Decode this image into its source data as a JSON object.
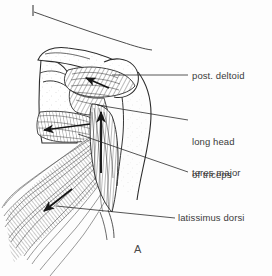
{
  "figure": {
    "panel_letter": "A",
    "view": "posterior shoulder dissection",
    "background_color": "#fdfdfd",
    "ink_color": "#2b2b2b",
    "text_color": "#3b3b3b"
  },
  "labels": [
    {
      "id": "post-deltoid",
      "text": "post. deltoid",
      "leader_from": [
        188,
        74
      ],
      "leader_to": [
        112,
        74
      ]
    },
    {
      "id": "long-head-of-triceps",
      "line1": "long head",
      "line2": "of triceps",
      "leader_from": [
        188,
        121
      ],
      "leader_to": [
        97,
        105
      ]
    },
    {
      "id": "teres-major",
      "text": "teres major",
      "leader_from": [
        188,
        172
      ],
      "leader_to": [
        78,
        135
      ]
    },
    {
      "id": "latissimus-dorsi",
      "text": "latissimus dorsi",
      "leader_from": [
        174,
        218
      ],
      "leader_to": [
        55,
        207
      ]
    }
  ],
  "pointer": {
    "id": "top-tick-leader",
    "tick": [
      33,
      5,
      33,
      15
    ],
    "line_to": [
      152,
      46
    ]
  },
  "force_arrows": [
    {
      "id": "deltoid-arrow",
      "x1": 109,
      "y1": 88,
      "x2": 86,
      "y2": 78,
      "label": "post. deltoid pull"
    },
    {
      "id": "teres-major-arrow",
      "x1": 88,
      "y1": 124,
      "x2": 44,
      "y2": 130,
      "label": "teres major pull"
    },
    {
      "id": "triceps-arrow",
      "x1": 101,
      "y1": 172,
      "x2": 101,
      "y2": 112,
      "label": "long head of triceps pull"
    },
    {
      "id": "latissimus-arrow",
      "x1": 70,
      "y1": 190,
      "x2": 43,
      "y2": 212,
      "label": "latissimus dorsi pull"
    }
  ],
  "structures": [
    {
      "id": "scapula",
      "name": "scapula"
    },
    {
      "id": "acromion",
      "name": "acromion"
    },
    {
      "id": "humerus",
      "name": "humerus"
    },
    {
      "id": "posterior-deltoid-muscle",
      "name": "posterior deltoid"
    },
    {
      "id": "teres-major-muscle",
      "name": "teres major"
    },
    {
      "id": "latissimus-dorsi-muscle",
      "name": "latissimus dorsi"
    },
    {
      "id": "triceps-long-head-muscle",
      "name": "long head of triceps"
    }
  ]
}
